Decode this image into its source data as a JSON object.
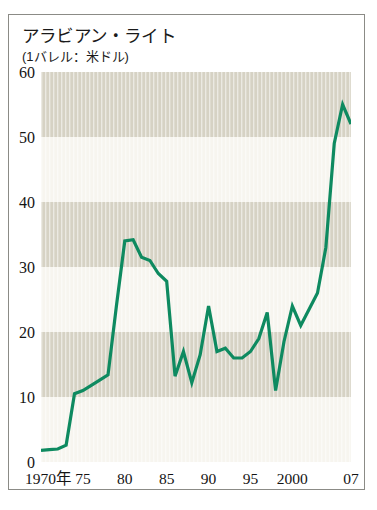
{
  "figure": {
    "title": "アラビアン・ライト",
    "subtitle": "(1バレル：米ドル)"
  },
  "chart_data": {
    "type": "line",
    "title": "アラビアン・ライト",
    "subtitle": "(1バレル：米ドル)",
    "xlabel": "",
    "ylabel": "",
    "unit": "1バレル：米ドル",
    "xlim": [
      1970,
      2007
    ],
    "ylim": [
      0,
      60
    ],
    "grid": false,
    "banded_background": true,
    "band_color": "#d6d2c4",
    "band_alt_color": "#f7f5ef",
    "line_color": "#0e8a60",
    "legend": null,
    "yticks": [
      0,
      10,
      20,
      30,
      40,
      50,
      60
    ],
    "ytick_labels": [
      "0",
      "10",
      "20",
      "30",
      "40",
      "50",
      "60"
    ],
    "xticks": [
      1970,
      1975,
      1980,
      1985,
      1990,
      1995,
      2000,
      2007
    ],
    "xtick_labels": [
      "1970年",
      "75",
      "80",
      "85",
      "90",
      "95",
      "2000",
      "07"
    ],
    "x": [
      1970,
      1971,
      1972,
      1973,
      1974,
      1975,
      1976,
      1977,
      1978,
      1979,
      1980,
      1981,
      1982,
      1983,
      1984,
      1985,
      1986,
      1987,
      1988,
      1989,
      1990,
      1991,
      1992,
      1993,
      1994,
      1995,
      1996,
      1997,
      1998,
      1999,
      2000,
      2001,
      2002,
      2003,
      2004,
      2005,
      2006,
      2007
    ],
    "values": [
      1.8,
      1.9,
      2.0,
      2.6,
      10.5,
      11.0,
      11.8,
      12.6,
      13.4,
      24.0,
      34.0,
      34.2,
      31.5,
      31.0,
      29.0,
      27.8,
      13.2,
      17.0,
      12.2,
      16.5,
      24.0,
      17.0,
      17.5,
      16.0,
      16.0,
      17.0,
      19.0,
      23.0,
      11.0,
      18.5,
      24.0,
      21.0,
      23.5,
      26.0,
      33.0,
      49.0,
      55.0,
      52.0
    ],
    "series": [
      {
        "name": "アラビアン・ライト",
        "color": "#0e8a60",
        "values": [
          1.8,
          1.9,
          2.0,
          2.6,
          10.5,
          11.0,
          11.8,
          12.6,
          13.4,
          24.0,
          34.0,
          34.2,
          31.5,
          31.0,
          29.0,
          27.8,
          13.2,
          17.0,
          12.2,
          16.5,
          24.0,
          17.0,
          17.5,
          16.0,
          16.0,
          17.0,
          19.0,
          23.0,
          11.0,
          18.5,
          24.0,
          21.0,
          23.5,
          26.0,
          33.0,
          49.0,
          55.0,
          52.0
        ]
      }
    ]
  }
}
